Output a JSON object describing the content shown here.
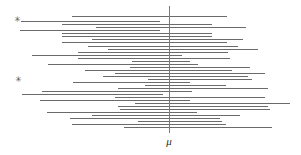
{
  "figure": {
    "width": 301,
    "height": 155,
    "background_color": "#ffffff",
    "line_color": "#6b6b6b",
    "axis_color": "#7a7a7a",
    "marker_color": "#4a4a4a",
    "label_color": "#2b2b2b"
  },
  "axis": {
    "mu_label": "μ",
    "mu_x": 168.5,
    "line_top": 6,
    "line_bottom": 133,
    "label_x": 162,
    "label_y": 136
  },
  "markers": [
    {
      "glyph": "✳",
      "name": "miss-marker-upper",
      "x": 13,
      "y": 16
    },
    {
      "glyph": "✳",
      "name": "miss-marker-lower",
      "x": 14,
      "y": 76
    }
  ],
  "chart_data": {
    "type": "line",
    "xlabel": "",
    "ylabel": "",
    "legend": [],
    "grid": false,
    "annotations": [
      {
        "text": "μ",
        "kind": "axis-label",
        "x": 168.5
      },
      {
        "text": "✳",
        "kind": "non-covering-interval-marker",
        "interval_index": 1
      },
      {
        "text": "✳",
        "kind": "non-covering-interval-marker",
        "interval_index": 25
      }
    ],
    "mu": 168.5,
    "xlim": [
      0,
      301
    ],
    "intervals": [
      {
        "index": 0,
        "y": 16,
        "x1": 72,
        "x2": 227,
        "covers_mu": true
      },
      {
        "index": 1,
        "y": 21,
        "x1": 21,
        "x2": 160,
        "covers_mu": false
      },
      {
        "index": 2,
        "y": 24,
        "x1": 62,
        "x2": 212,
        "covers_mu": true
      },
      {
        "index": 3,
        "y": 27,
        "x1": 96,
        "x2": 246,
        "covers_mu": true
      },
      {
        "index": 4,
        "y": 30,
        "x1": 20,
        "x2": 160,
        "covers_mu": false
      },
      {
        "index": 5,
        "y": 33,
        "x1": 62,
        "x2": 212,
        "covers_mu": true
      },
      {
        "index": 6,
        "y": 36,
        "x1": 62,
        "x2": 212,
        "covers_mu": true
      },
      {
        "index": 7,
        "y": 39,
        "x1": 92,
        "x2": 243,
        "covers_mu": true
      },
      {
        "index": 8,
        "y": 42,
        "x1": 62,
        "x2": 227,
        "covers_mu": true
      },
      {
        "index": 9,
        "y": 46,
        "x1": 88,
        "x2": 238,
        "covers_mu": true
      },
      {
        "index": 10,
        "y": 49,
        "x1": 108,
        "x2": 258,
        "covers_mu": true
      },
      {
        "index": 11,
        "y": 52,
        "x1": 78,
        "x2": 228,
        "covers_mu": true
      },
      {
        "index": 12,
        "y": 55,
        "x1": 32,
        "x2": 182,
        "covers_mu": true
      },
      {
        "index": 13,
        "y": 58,
        "x1": 78,
        "x2": 230,
        "covers_mu": true
      },
      {
        "index": 14,
        "y": 61,
        "x1": 132,
        "x2": 190,
        "covers_mu": true
      },
      {
        "index": 15,
        "y": 64,
        "x1": 48,
        "x2": 198,
        "covers_mu": true
      },
      {
        "index": 16,
        "y": 67,
        "x1": 130,
        "x2": 250,
        "covers_mu": true
      },
      {
        "index": 17,
        "y": 70,
        "x1": 85,
        "x2": 232,
        "covers_mu": true
      },
      {
        "index": 18,
        "y": 73,
        "x1": 115,
        "x2": 265,
        "covers_mu": true
      },
      {
        "index": 19,
        "y": 76,
        "x1": 103,
        "x2": 248,
        "covers_mu": true
      },
      {
        "index": 20,
        "y": 79,
        "x1": 148,
        "x2": 252,
        "covers_mu": true
      },
      {
        "index": 21,
        "y": 82,
        "x1": 73,
        "x2": 190,
        "covers_mu": true
      },
      {
        "index": 22,
        "y": 85,
        "x1": 145,
        "x2": 226,
        "covers_mu": true
      },
      {
        "index": 23,
        "y": 88,
        "x1": 118,
        "x2": 268,
        "covers_mu": true
      },
      {
        "index": 24,
        "y": 91,
        "x1": 42,
        "x2": 192,
        "covers_mu": true
      },
      {
        "index": 25,
        "y": 94,
        "x1": 22,
        "x2": 163,
        "covers_mu": false
      },
      {
        "index": 26,
        "y": 97,
        "x1": 115,
        "x2": 265,
        "covers_mu": true
      },
      {
        "index": 27,
        "y": 100,
        "x1": 40,
        "x2": 190,
        "covers_mu": true
      },
      {
        "index": 28,
        "y": 103,
        "x1": 135,
        "x2": 290,
        "covers_mu": true
      },
      {
        "index": 29,
        "y": 106,
        "x1": 118,
        "x2": 268,
        "covers_mu": true
      },
      {
        "index": 30,
        "y": 109,
        "x1": 120,
        "x2": 270,
        "covers_mu": true
      },
      {
        "index": 31,
        "y": 112,
        "x1": 47,
        "x2": 197,
        "covers_mu": true
      },
      {
        "index": 32,
        "y": 115,
        "x1": 92,
        "x2": 240,
        "covers_mu": true
      },
      {
        "index": 33,
        "y": 118,
        "x1": 70,
        "x2": 220,
        "covers_mu": true
      },
      {
        "index": 34,
        "y": 121,
        "x1": 138,
        "x2": 222,
        "covers_mu": true
      },
      {
        "index": 35,
        "y": 124,
        "x1": 72,
        "x2": 226,
        "covers_mu": true
      },
      {
        "index": 36,
        "y": 127,
        "x1": 124,
        "x2": 272,
        "covers_mu": true
      }
    ]
  }
}
